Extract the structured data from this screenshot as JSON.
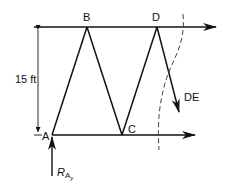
{
  "diagram": {
    "type": "truss-section-cut",
    "nodes": {
      "A": {
        "label": "A"
      },
      "B": {
        "label": "B"
      },
      "C": {
        "label": "C"
      },
      "D": {
        "label": "D"
      }
    },
    "dimension": {
      "label": "15 ft"
    },
    "member_force": {
      "label": "DE"
    },
    "reaction": {
      "main": "R",
      "sub1": "A",
      "sub2": "y"
    },
    "colors": {
      "line": "#111111",
      "background": "#ffffff",
      "dashed": "#444444"
    }
  }
}
